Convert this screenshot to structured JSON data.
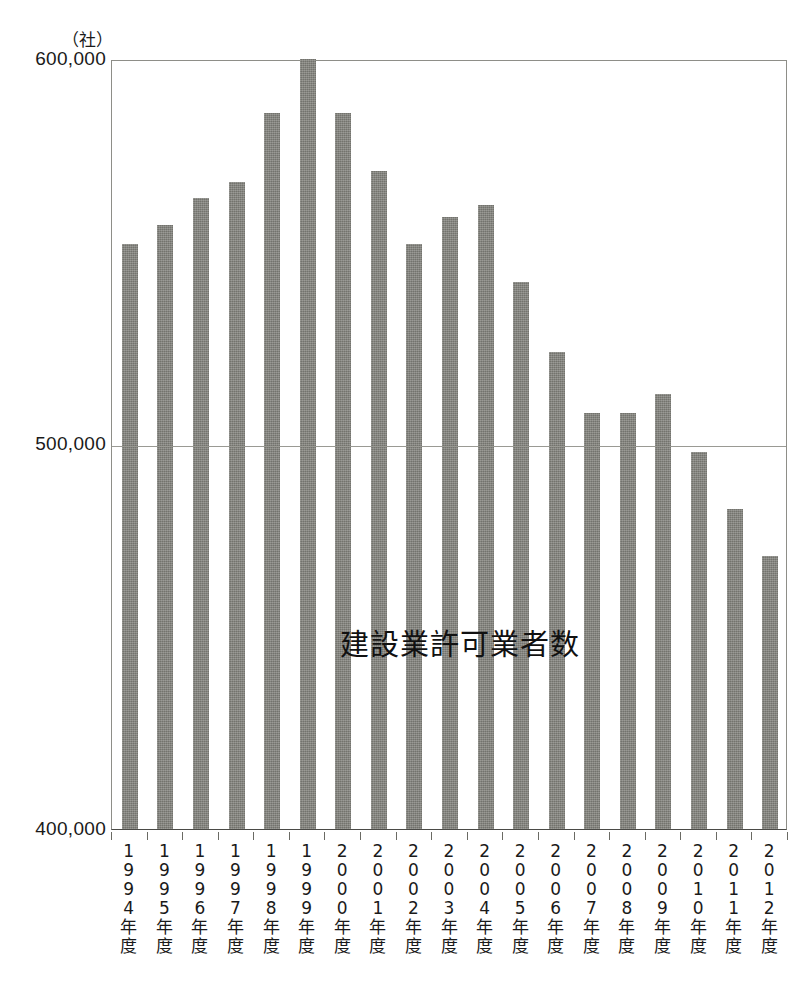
{
  "chart_data": {
    "type": "bar",
    "title": "",
    "series_label": "建設業許可業者数",
    "unit_label": "（社）",
    "xlabel": "",
    "ylabel": "",
    "ylim": [
      400000,
      600000
    ],
    "yticks": [
      400000,
      500000,
      600000
    ],
    "ytick_labels": [
      "400,000",
      "500,000",
      "600,000"
    ],
    "grid": true,
    "legend_position": "inline-center",
    "categories": [
      "1994年度",
      "1995年度",
      "1996年度",
      "1997年度",
      "1998年度",
      "1999年度",
      "2000年度",
      "2001年度",
      "2002年度",
      "2003年度",
      "2004年度",
      "2005年度",
      "2006年度",
      "2007年度",
      "2008年度",
      "2009年度",
      "2010年度",
      "2011年度",
      "2012年度"
    ],
    "category_years": [
      "1994",
      "1995",
      "1996",
      "1997",
      "1998",
      "1999",
      "2000",
      "2001",
      "2002",
      "2003",
      "2004",
      "2005",
      "2006",
      "2007",
      "2008",
      "2009",
      "2010",
      "2011",
      "2012"
    ],
    "category_suffix": "年度",
    "values": [
      552000,
      557000,
      564000,
      568000,
      586000,
      600000,
      586000,
      571000,
      552000,
      559000,
      562000,
      542000,
      524000,
      508000,
      508000,
      513000,
      498000,
      483000,
      471000
    ],
    "bar_color": "#7e7e78",
    "axis_color": "#4a4a46",
    "grid_color": "#9a9a94",
    "background_color": "#ffffff"
  }
}
